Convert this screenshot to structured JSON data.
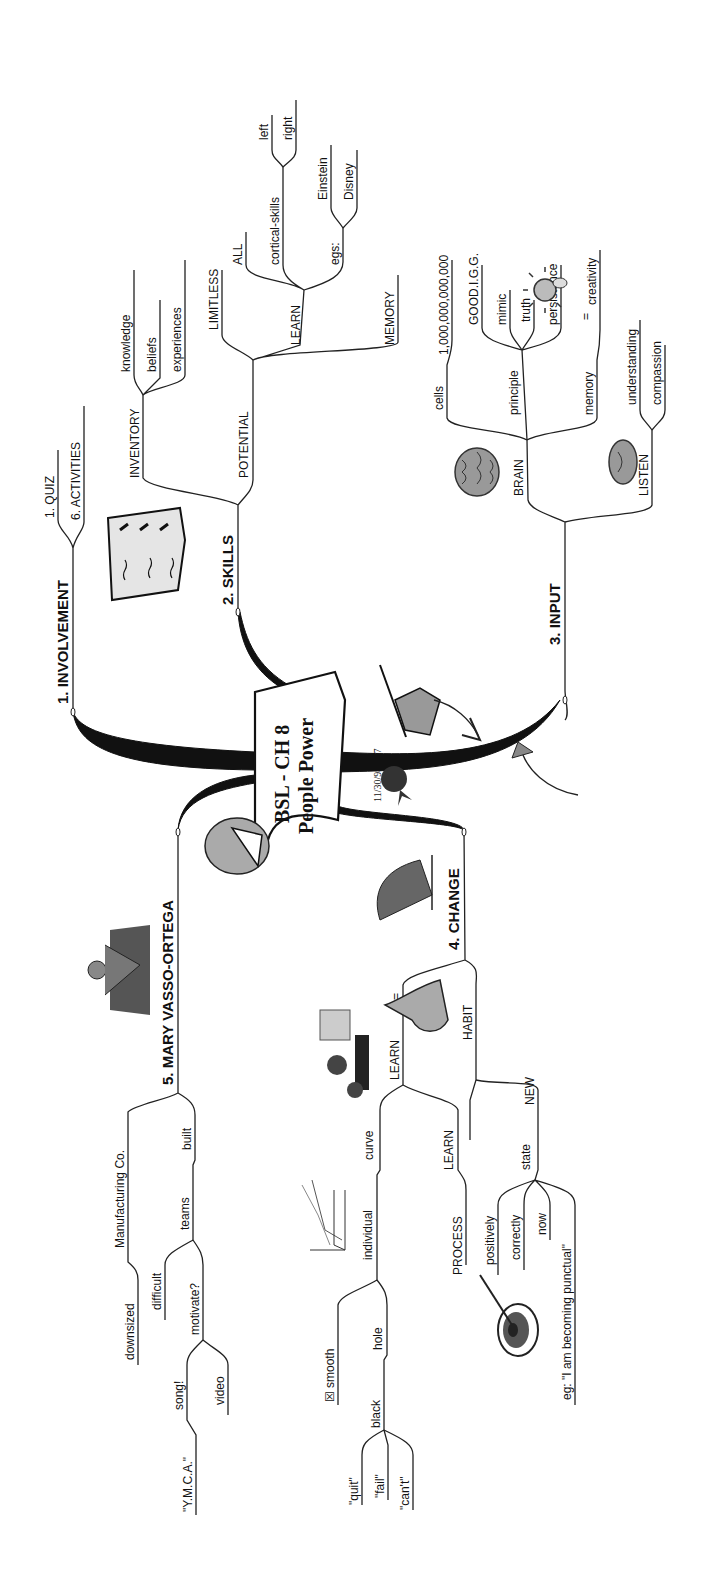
{
  "central": {
    "title": "BSL - CH 8",
    "subtitle": "People Power",
    "date": "11/30/98 - v7"
  },
  "branches": {
    "involvement": {
      "label": "1. INVOLVEMENT",
      "children": [
        "1. QUIZ",
        "6. ACTIVITIES"
      ]
    },
    "skills": {
      "label": "2. SKILLS",
      "inventory": {
        "label": "INVENTORY",
        "children": [
          "knowledge",
          "beliefs",
          "experiences"
        ]
      },
      "potential": {
        "label": "POTENTIAL",
        "limitless": "LIMITLESS",
        "learn": {
          "label": "LEARN",
          "all": "ALL",
          "cortical": {
            "label": "cortical-skills",
            "children": [
              "left",
              "right"
            ]
          },
          "egs": {
            "label": "egs:",
            "children": [
              "Einstein",
              "Disney"
            ]
          }
        },
        "memory": "MEMORY"
      }
    },
    "input": {
      "label": "3. INPUT",
      "brain": {
        "label": "BRAIN",
        "cells": {
          "label": "cells",
          "value": "1,000,000,000,000"
        },
        "principle": {
          "label": "principle",
          "children": [
            "GOOD.I.G.G.",
            "mimic",
            "truth",
            "persistence"
          ]
        },
        "memory": {
          "label": "memory",
          "equals": "=",
          "result": "creativity"
        }
      },
      "listen": {
        "label": "LISTEN",
        "children": [
          "understanding",
          "compassion"
        ]
      }
    },
    "change": {
      "label": "4. CHANGE",
      "learn": {
        "label": "LEARN",
        "equals": "=",
        "curve": {
          "label": "curve",
          "individual": {
            "label": "individual",
            "smooth": "smooth",
            "smooth_marker": "☒",
            "hole": {
              "label": "hole",
              "black": {
                "label": "black",
                "children": [
                  "\"quit\"",
                  "\"fail\"",
                  "\"can't\""
                ]
              }
            }
          }
        },
        "process": {
          "label": "LEARN",
          "child": "PROCESS"
        }
      },
      "habit": {
        "label": "HABIT",
        "new": {
          "label": "NEW",
          "state": {
            "label": "state",
            "children": [
              "positively",
              "correctly",
              "now",
              "eg: \"I am becoming punctual\""
            ]
          }
        }
      }
    },
    "mary": {
      "label": "5. MARY VASSO-ORTEGA",
      "built": {
        "label": "built",
        "manufacturing": {
          "label": "Manufacturing Co.",
          "child": "downsized"
        },
        "teams": {
          "label": "teams",
          "difficult": "difficult",
          "motivate": {
            "label": "motivate?",
            "song": {
              "label": "song!",
              "child": "\"Y.M.C.A.\""
            },
            "video": "video"
          }
        }
      }
    }
  },
  "icons": [
    "checklist-icon",
    "brain-icon",
    "lightbulb-icon",
    "ear-icon",
    "writing-hand-icon",
    "rosette-icon",
    "laughing-face-icon",
    "sailboat-icon",
    "meditating-person-icon",
    "classroom-icon",
    "learning-curve-chart-icon",
    "thumb-hand-icon",
    "target-arrow-icon",
    "curved-arrow-icon"
  ]
}
